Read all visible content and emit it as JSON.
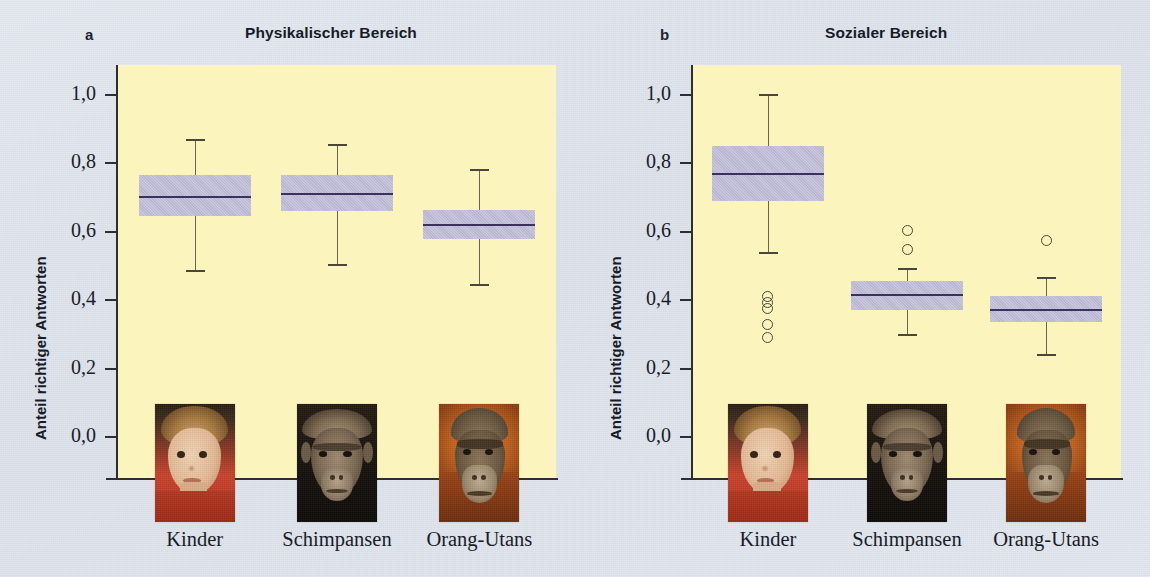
{
  "figure": {
    "background_color": "#dfe4ec",
    "plot_background_color": "#fbf5bd",
    "box_fill_color": "#bfbcd8",
    "median_color": "#3b3060",
    "whisker_color": "#6a6550",
    "outlier_color": "#4a4632",
    "axis_color": "#2d2d33"
  },
  "panels": [
    {
      "letter": "a",
      "title": "Physikalischer Bereich",
      "ylabel": "Anteil richtiger Antworten",
      "ytick_labels": [
        "1,0",
        "0,8",
        "0,6",
        "0,4",
        "0,2",
        "0,0"
      ],
      "xtick_labels": [
        "Kinder",
        "Schimpansen",
        "Orang-Utans"
      ]
    },
    {
      "letter": "b",
      "title": "Sozialer Bereich",
      "ylabel": "Anteil richtiger Antworten",
      "ytick_labels": [
        "1,0",
        "0,8",
        "0,6",
        "0,4",
        "0,2",
        "0,0"
      ],
      "xtick_labels": [
        "Kinder",
        "Schimpansen",
        "Orang-Utans"
      ]
    }
  ],
  "photos": [
    {
      "name": "child-photo",
      "label": "Kinder"
    },
    {
      "name": "chimpanzee-photo",
      "label": "Schimpansen"
    },
    {
      "name": "orangutan-photo",
      "label": "Orang-Utans"
    }
  ],
  "chart_data": [
    {
      "type": "box",
      "title": "Physikalischer Bereich",
      "panel": "a",
      "xlabel": "",
      "ylabel": "Anteil richtiger Antworten",
      "ylim": [
        0.0,
        1.0
      ],
      "yticks": [
        0.0,
        0.2,
        0.4,
        0.6,
        0.8,
        1.0
      ],
      "ytick_labels": [
        "0,0",
        "0,2",
        "0,4",
        "0,6",
        "0,8",
        "1,0"
      ],
      "grid": false,
      "legend": "none",
      "categories": [
        "Kinder",
        "Schimpansen",
        "Orang-Utans"
      ],
      "boxes": [
        {
          "category": "Kinder",
          "whisker_low": 0.485,
          "q1": 0.645,
          "median": 0.703,
          "q3": 0.765,
          "whisker_high": 0.868,
          "outliers": []
        },
        {
          "category": "Schimpansen",
          "whisker_low": 0.503,
          "q1": 0.662,
          "median": 0.71,
          "q3": 0.765,
          "whisker_high": 0.855,
          "outliers": []
        },
        {
          "category": "Orang-Utans",
          "whisker_low": 0.443,
          "q1": 0.578,
          "median": 0.619,
          "q3": 0.665,
          "whisker_high": 0.782,
          "outliers": []
        }
      ]
    },
    {
      "type": "box",
      "title": "Sozialer Bereich",
      "panel": "b",
      "xlabel": "",
      "ylabel": "Anteil richtiger Antworten",
      "ylim": [
        0.0,
        1.0
      ],
      "yticks": [
        0.0,
        0.2,
        0.4,
        0.6,
        0.8,
        1.0
      ],
      "ytick_labels": [
        "0,0",
        "0,2",
        "0,4",
        "0,6",
        "0,8",
        "1,0"
      ],
      "grid": false,
      "legend": "none",
      "categories": [
        "Kinder",
        "Schimpansen",
        "Orang-Utans"
      ],
      "boxes": [
        {
          "category": "Kinder",
          "whisker_low": 0.537,
          "q1": 0.691,
          "median": 0.77,
          "q3": 0.851,
          "whisker_high": 1.0,
          "outliers": [
            0.412,
            0.392,
            0.375,
            0.33,
            0.292
          ]
        },
        {
          "category": "Schimpansen",
          "whisker_low": 0.297,
          "q1": 0.372,
          "median": 0.414,
          "q3": 0.455,
          "whisker_high": 0.492,
          "outliers": [
            0.604,
            0.548
          ]
        },
        {
          "category": "Orang-Utans",
          "whisker_low": 0.24,
          "q1": 0.337,
          "median": 0.372,
          "q3": 0.412,
          "whisker_high": 0.466,
          "outliers": [
            0.575
          ]
        }
      ]
    }
  ]
}
